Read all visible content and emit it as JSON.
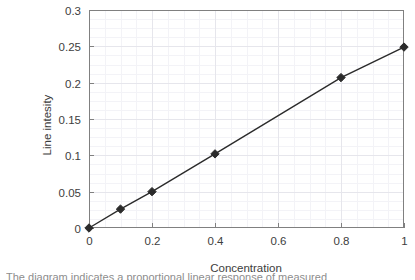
{
  "chart_data": {
    "type": "line",
    "title": "",
    "subtitle": "",
    "xlabel": "Concentration",
    "ylabel": "Line intesity",
    "xlim": [
      0,
      1
    ],
    "ylim": [
      0,
      0.3
    ],
    "xticks": [
      "0",
      "0.2",
      "0.4",
      "0.6",
      "0.8",
      "1"
    ],
    "xtick_values": [
      0,
      0.2,
      0.4,
      0.6,
      0.8,
      1
    ],
    "yticks": [
      "0",
      "0.05",
      "0.1",
      "0.15",
      "0.2",
      "0.25",
      "0.3"
    ],
    "ytick_values": [
      0,
      0.05,
      0.1,
      0.15,
      0.2,
      0.25,
      0.3
    ],
    "grid": true,
    "grid_minor": true,
    "legend": false,
    "legend_position": "none",
    "marker": "diamond",
    "series": [
      {
        "name": "Calibration curve",
        "x": [
          0,
          0.1,
          0.2,
          0.4,
          0.8,
          1
        ],
        "values": [
          0,
          0.026,
          0.05,
          0.102,
          0.207,
          0.249
        ],
        "color": "#2b2b2b"
      }
    ]
  },
  "style": {
    "axis_color": "#808080",
    "grid_color": "#e8e8ee",
    "grid_minor_color": "#f3f3f7",
    "line_color": "#2b2b2b",
    "marker_color": "#2b2b2b",
    "text_color": "#3d3d3d",
    "background": "#ffffff"
  },
  "caption": {
    "clipped_text": "The diagram indicates a proportional linear response of measured"
  }
}
